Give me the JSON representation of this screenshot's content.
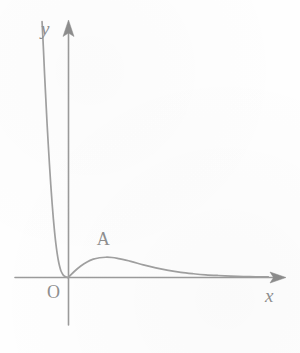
{
  "figure": {
    "title": "",
    "background_color": "#fefefe",
    "stroke_color": "#9b9b9b",
    "label_color": "#8e8e8e"
  },
  "labels": {
    "y_axis": "y",
    "x_axis": "x",
    "origin": "O",
    "point_a": "A"
  },
  "chart_data": {
    "type": "line",
    "title": "",
    "subtitle": "",
    "xlabel": "x",
    "ylabel": "y",
    "grid": false,
    "legend": null,
    "legend_position": "none",
    "axes": {
      "origin_label": "O",
      "x_axis": {
        "label": "x",
        "direction": "right",
        "arrow": true,
        "ticks": [],
        "tick_labels": [],
        "range_shown": [
          -1.1,
          8.6
        ]
      },
      "y_axis": {
        "label": "y",
        "direction": "up",
        "arrow": true,
        "ticks": [],
        "tick_labels": [],
        "range_shown": [
          -1.7,
          9.3
        ]
      }
    },
    "annotations": [
      {
        "text": "A",
        "kind": "local-maximum-label",
        "x": 1.5,
        "y": 0.72,
        "note": "labels the local maximum of the curve"
      }
    ],
    "series": [
      {
        "name": "curve",
        "description": "single continuous curve; rises steeply toward +infinity as x decreases below 0, passes through the origin, rises to a local maximum at A, then decays asymptotically toward the x-axis",
        "x": [
          -1.05,
          -1.0,
          -0.95,
          -0.9,
          -0.85,
          -0.8,
          -0.75,
          -0.7,
          -0.65,
          -0.6,
          -0.55,
          -0.5,
          -0.45,
          -0.4,
          -0.35,
          -0.3,
          -0.25,
          -0.2,
          -0.15,
          -0.1,
          -0.05,
          0.0,
          0.25,
          0.5,
          0.75,
          1.0,
          1.25,
          1.5,
          1.75,
          2.0,
          2.5,
          3.0,
          3.5,
          4.0,
          4.5,
          5.0,
          5.5,
          6.0,
          6.5,
          7.0,
          7.5,
          8.0
        ],
        "y": [
          9.3,
          8.4,
          7.4,
          6.5,
          5.6,
          4.8,
          4.05,
          3.35,
          2.72,
          2.15,
          1.66,
          1.24,
          0.9,
          0.62,
          0.41,
          0.25,
          0.15,
          0.08,
          0.04,
          0.015,
          0.004,
          0.0,
          0.22,
          0.41,
          0.56,
          0.66,
          0.71,
          0.73,
          0.72,
          0.68,
          0.58,
          0.45,
          0.34,
          0.25,
          0.18,
          0.13,
          0.09,
          0.065,
          0.045,
          0.03,
          0.02,
          0.015
        ]
      }
    ],
    "key_points": [
      {
        "name": "O",
        "label": "O",
        "x": 0,
        "y": 0,
        "note": "origin, curve touches axes here"
      },
      {
        "name": "A",
        "label": "A",
        "x": 1.5,
        "y": 0.73,
        "note": "local maximum of the curve"
      }
    ],
    "xlim": [
      -1.1,
      8.6
    ],
    "ylim": [
      -1.7,
      9.3
    ]
  }
}
